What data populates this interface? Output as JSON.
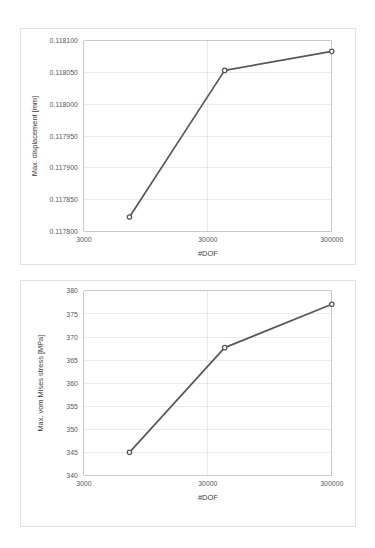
{
  "page": {
    "background_color": "#ffffff",
    "card_border_color": "#e2e2e2"
  },
  "charts": {
    "displacement": {
      "card_name": "max-displacement-chart-card",
      "y_ticks": [
        "0.118100",
        "0.118050",
        "0.118000",
        "0.117950",
        "0.117900",
        "0.117850",
        "0.117800"
      ],
      "x_ticks": [
        "3000",
        "30000",
        "300000"
      ],
      "y_title": "Max. displacement [mm]",
      "x_title": "#DOF",
      "line_color": "#54585a",
      "marker_fill": "#ffffff",
      "grid_color": "#e9e9e9"
    },
    "stress": {
      "card_name": "max-von-mises-stress-chart-card",
      "y_ticks": [
        "380",
        "375",
        "370",
        "365",
        "360",
        "355",
        "350",
        "345",
        "340"
      ],
      "x_ticks": [
        "3000",
        "30000",
        "300000"
      ],
      "y_title": "Max. vom Mises stress [MPa]",
      "x_title": "#DOF",
      "line_color": "#54585a",
      "marker_fill": "#ffffff",
      "grid_color": "#e9e9e9"
    }
  },
  "chart_data": [
    {
      "id": "max-displacement-vs-dof",
      "type": "line",
      "title": "",
      "xlabel": "#DOF",
      "ylabel": "Max. displacement [mm]",
      "xscale": "log",
      "yscale": "linear",
      "xlim": [
        3000,
        300000
      ],
      "ylim": [
        0.1178,
        0.1181
      ],
      "xticks": [
        3000,
        30000,
        300000
      ],
      "xticklabels": [
        "3000",
        "30000",
        "300000"
      ],
      "yticks": [
        0.1178,
        0.11785,
        0.1179,
        0.11795,
        0.118,
        0.11805,
        0.1181
      ],
      "yticklabels": [
        "0.117800",
        "0.117850",
        "0.117900",
        "0.117950",
        "0.118000",
        "0.118050",
        "0.118100"
      ],
      "grid": true,
      "legend": false,
      "markers": "circle",
      "series": [
        {
          "name": "Max. displacement",
          "x": [
            7000,
            41000,
            300000
          ],
          "y": [
            0.1178225,
            0.1180535,
            0.1180835
          ]
        }
      ]
    },
    {
      "id": "max-von-mises-stress-vs-dof",
      "type": "line",
      "title": "",
      "xlabel": "#DOF",
      "ylabel": "Max. vom Mises stress [MPa]",
      "xscale": "log",
      "yscale": "linear",
      "xlim": [
        3000,
        300000
      ],
      "ylim": [
        340,
        380
      ],
      "xticks": [
        3000,
        30000,
        300000
      ],
      "xticklabels": [
        "3000",
        "30000",
        "300000"
      ],
      "yticks": [
        340,
        345,
        350,
        355,
        360,
        365,
        370,
        375,
        380
      ],
      "yticklabels": [
        "340",
        "345",
        "350",
        "355",
        "360",
        "365",
        "370",
        "375",
        "380"
      ],
      "grid": true,
      "legend": false,
      "markers": "circle",
      "series": [
        {
          "name": "Max. vom Mises stress",
          "x": [
            7000,
            41000,
            300000
          ],
          "y": [
            345.0,
            367.7,
            377.1
          ]
        }
      ]
    }
  ]
}
